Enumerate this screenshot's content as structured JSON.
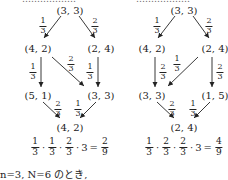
{
  "left_diagram": {
    "nodes": {
      "top": "(3, 3)",
      "mid_left": "(4, 2)",
      "mid_right": "(2, 4)",
      "low_left": "(5, 1)",
      "low_right": "(3, 3)",
      "bottom": "(4, 2)"
    },
    "edges": {
      "top_to_mid_left": {
        "num": "1",
        "den": "3"
      },
      "top_to_mid_right": {
        "num": "2",
        "den": "3"
      },
      "mid_left_to_low_left": {
        "num": "1",
        "den": "3"
      },
      "mid_left_to_low_right": {
        "num": "2",
        "den": "3"
      },
      "mid_right_to_low_right": {
        "num": "1",
        "den": "3"
      },
      "low_left_to_bottom": {
        "num": "2",
        "den": "3"
      },
      "low_right_to_bottom": {
        "num": "1",
        "den": "3"
      }
    },
    "equation": {
      "f1": {
        "num": "1",
        "den": "3"
      },
      "f2": {
        "num": "1",
        "den": "3"
      },
      "f3": {
        "num": "2",
        "den": "3"
      },
      "dot": "·",
      "multiplier": "3",
      "equals": "=",
      "result": {
        "num": "2",
        "den": "9"
      }
    }
  },
  "right_diagram": {
    "nodes": {
      "top": "(3, 3)",
      "mid_left": "(4, 2)",
      "mid_right": "(2, 4)",
      "low_left": "(3, 3)",
      "low_right": "(1, 5)",
      "bottom": "(2, 4)"
    },
    "edges": {
      "top_to_mid_left": {
        "num": "1",
        "den": "3"
      },
      "top_to_mid_right": {
        "num": "2",
        "den": "3"
      },
      "mid_left_to_low_left": {
        "num": "2",
        "den": "3"
      },
      "mid_right_to_low_left": {
        "num": "1",
        "den": "3"
      },
      "mid_right_to_low_right": {
        "num": "2",
        "den": "3"
      },
      "low_left_to_bottom": {
        "num": "2",
        "den": "3"
      },
      "low_right_to_bottom": {
        "num": "1",
        "den": "3"
      }
    },
    "equation": {
      "f1": {
        "num": "1",
        "den": "3"
      },
      "f2": {
        "num": "2",
        "den": "3"
      },
      "f3": {
        "num": "2",
        "den": "3"
      },
      "dot": "·",
      "multiplier": "3",
      "equals": "=",
      "result": {
        "num": "4",
        "den": "9"
      }
    }
  },
  "caption": "n=3, N=6 のとき,"
}
